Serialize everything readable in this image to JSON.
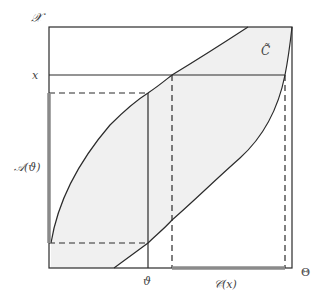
{
  "diagram": {
    "labels": {
      "y_axis": "𝒳",
      "x_level": "x",
      "set_label": "C̃",
      "a_theta": "𝒜(ϑ)",
      "theta": "ϑ",
      "c_x": "𝒞(x)",
      "x_axis": "Θ"
    },
    "colors": {
      "stroke": "#2b2b2b",
      "fill": "#f0f0f0",
      "highlight": "#8a8a8a",
      "label": "#444444"
    }
  }
}
